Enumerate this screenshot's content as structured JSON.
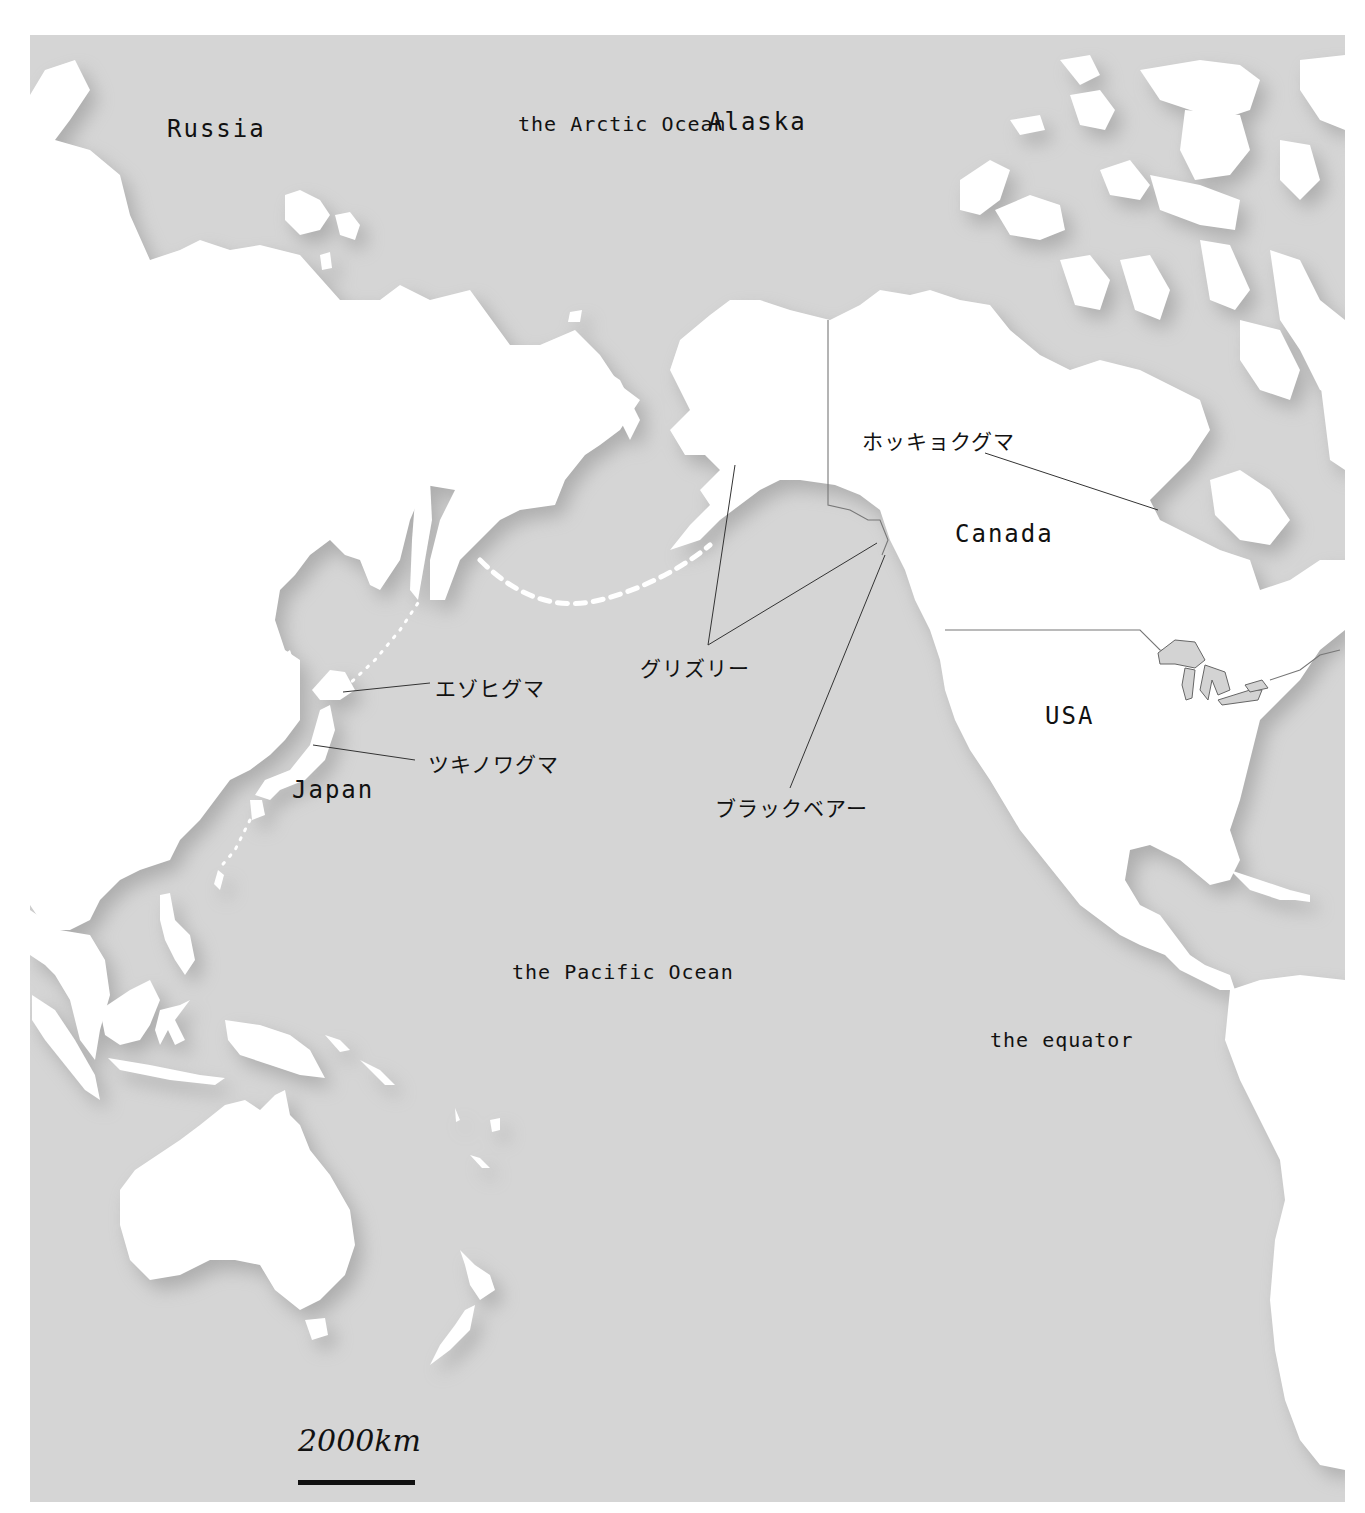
{
  "map": {
    "ocean_color": "#d5d5d5",
    "land_color": "#ffffff",
    "oceans": {
      "arctic": "the Arctic Ocean",
      "pacific": "the Pacific Ocean"
    },
    "equator_label": "the equator",
    "places": {
      "russia": "Russia",
      "alaska": "Alaska",
      "canada": "Canada",
      "usa": "USA",
      "japan": "Japan"
    },
    "bears": {
      "polar": "ホッキョクグマ",
      "brown_hokkaido": "エゾヒグマ",
      "asian_black": "ツキノワグマ",
      "grizzly": "グリズリー",
      "black_bear": "ブラックベアー"
    },
    "scale": {
      "label": "2000km"
    }
  }
}
